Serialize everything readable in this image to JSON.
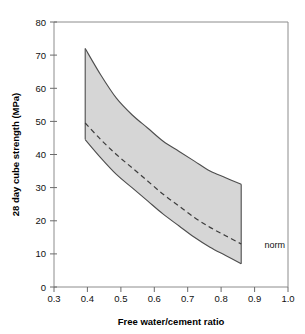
{
  "chart_data": {
    "type": "area",
    "title": "",
    "subtitle": "",
    "xlabel": "Free water/cement ratio",
    "ylabel": "28 day cube strength (MPa)",
    "xlim": [
      0.3,
      1.05
    ],
    "ylim": [
      0,
      80
    ],
    "grid": false,
    "legend_position": "none",
    "x_ticks": [
      "0.3",
      "0.4",
      "0.5",
      "0.6",
      "0.7",
      "0.8",
      "0.9",
      "1.0"
    ],
    "x_tick_values": [
      0.3,
      0.4,
      0.5,
      0.6,
      0.7,
      0.8,
      0.9,
      1.0
    ],
    "y_ticks": [
      "0",
      "10",
      "20",
      "30",
      "40",
      "50",
      "60",
      "70",
      "80"
    ],
    "y_tick_values": [
      0,
      10,
      20,
      30,
      40,
      50,
      60,
      70,
      80
    ],
    "x": [
      0.4,
      0.45,
      0.5,
      0.55,
      0.6,
      0.65,
      0.7,
      0.75,
      0.8,
      0.85,
      0.9
    ],
    "series": [
      {
        "name": "upper bound",
        "style": "solid",
        "values": [
          72.0,
          64.0,
          57.0,
          52.0,
          48.0,
          44.0,
          41.0,
          38.0,
          35.0,
          33.0,
          31.0
        ]
      },
      {
        "name": "norm",
        "style": "dashed",
        "values": [
          49.5,
          44.5,
          40.0,
          36.0,
          32.0,
          28.0,
          24.5,
          21.0,
          18.0,
          15.5,
          13.0
        ]
      },
      {
        "name": "lower bound",
        "style": "solid",
        "values": [
          44.5,
          39.0,
          34.0,
          30.0,
          26.0,
          22.0,
          18.5,
          15.0,
          12.0,
          9.5,
          7.0
        ]
      }
    ],
    "band": {
      "upper_series": "upper bound",
      "lower_series": "lower bound",
      "fill_color": "#d6d6d6"
    },
    "annotations": [
      {
        "name": "norm",
        "text": "norm",
        "x": 0.93,
        "y": 13.0
      }
    ]
  },
  "colors": {
    "band_fill": "#d6d6d6",
    "curve_stroke": "#4d4d4d",
    "norm_stroke": "#3d3d3d",
    "frame_stroke": "#8c8c8c",
    "background": "#ffffff",
    "text": "#111111"
  }
}
